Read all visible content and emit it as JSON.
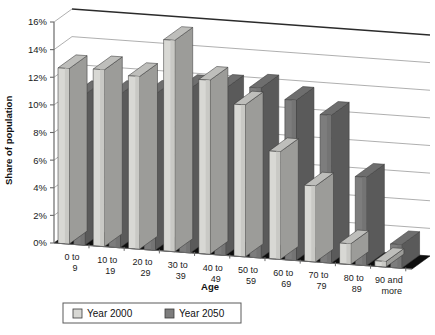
{
  "chart_data": {
    "type": "bar",
    "title": "",
    "subtitle": "",
    "xlabel": "Age",
    "ylabel": "Share of population",
    "categories": [
      "0 to 9",
      "10 to 19",
      "20 to 29",
      "30 to 39",
      "40 to 49",
      "50 to 59",
      "60 to 69",
      "70 to 79",
      "80 to 89",
      "90 and more"
    ],
    "series": [
      {
        "name": "Year 2000",
        "color": "#d8d8d4",
        "values": [
          12.7,
          12.8,
          12.5,
          15.3,
          12.6,
          11.0,
          7.8,
          5.5,
          1.5,
          0.4
        ]
      },
      {
        "name": "Year 2050",
        "color": "#7d7d7d",
        "values": [
          10.9,
          11.1,
          11.3,
          11.9,
          12.1,
          12.3,
          11.6,
          10.7,
          6.4,
          1.7
        ]
      }
    ],
    "ylim": [
      0,
      16
    ],
    "ytick_values": [
      0,
      2,
      4,
      6,
      8,
      10,
      12,
      14,
      16
    ],
    "ytick_labels": [
      "0%",
      "2%",
      "4%",
      "6%",
      "8%",
      "10%",
      "12%",
      "14%",
      "16%"
    ],
    "grid": true,
    "three_d": true,
    "legend_position": "bottom",
    "legend": [
      "Year 2000",
      "Year 2050"
    ],
    "units": "percent"
  },
  "axes": {
    "y_title": "Share of population",
    "x_title": "Age"
  },
  "legend": {
    "items": [
      {
        "label": "Year 2000",
        "swatch": "light-swatch-icon"
      },
      {
        "label": "Year 2050",
        "swatch": "dark-swatch-icon"
      }
    ]
  },
  "colors": {
    "series_2000": "#d8d8d4",
    "series_2050": "#7d7d7d",
    "floor": "#0d0d0d",
    "grid": "#9a9a9a",
    "axis": "#6a6a6a",
    "text": "#111111"
  }
}
